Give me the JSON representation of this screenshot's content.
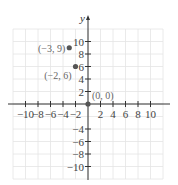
{
  "chart_data": {
    "type": "scatter",
    "title": "",
    "xlabel": "",
    "ylabel": "y",
    "xlim": [
      -12,
      12
    ],
    "ylim": [
      -12,
      12
    ],
    "grid": true,
    "x_ticks": [
      -10,
      -8,
      -6,
      -4,
      -2,
      2,
      4,
      6,
      8,
      10
    ],
    "y_ticks": [
      10,
      8,
      6,
      4,
      2,
      -4,
      -6,
      -8,
      -10
    ],
    "x_tick_labels": [
      "−10",
      "−8",
      "−6",
      "−4",
      "−2",
      "2",
      "4",
      "6",
      "8",
      "10"
    ],
    "y_tick_labels": [
      "10",
      "8",
      "6",
      "4",
      "2",
      "−4",
      "−6",
      "−8",
      "−10"
    ],
    "points": [
      {
        "x": -3,
        "y": 9,
        "label": "(−3, 9)"
      },
      {
        "x": -2,
        "y": 6,
        "label": "(−2, 6)"
      },
      {
        "x": 0,
        "y": 0,
        "label": "(0, 0)"
      }
    ],
    "colors": {
      "grid": "#e4e4e4",
      "axis": "#333333",
      "point": "#555555"
    }
  }
}
